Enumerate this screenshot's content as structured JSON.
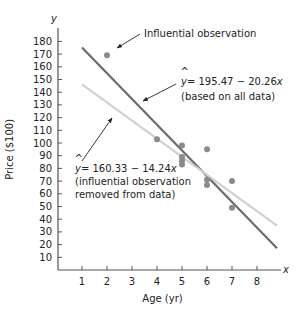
{
  "chart_data": {
    "type": "scatter",
    "title": "",
    "xlabel": "Age (yr)",
    "ylabel": "Price ($100)",
    "x_axis_symbol": "x",
    "y_axis_symbol": "y",
    "xlim": [
      0,
      9
    ],
    "ylim": [
      0,
      190
    ],
    "x_ticks": [
      1,
      2,
      3,
      4,
      5,
      6,
      7,
      8
    ],
    "y_ticks": [
      10,
      20,
      30,
      40,
      50,
      60,
      70,
      80,
      90,
      100,
      110,
      120,
      130,
      140,
      150,
      160,
      170,
      180
    ],
    "grid": false,
    "points": [
      {
        "x": 2,
        "y": 169,
        "influential": true
      },
      {
        "x": 4,
        "y": 103
      },
      {
        "x": 5,
        "y": 98
      },
      {
        "x": 5,
        "y": 89
      },
      {
        "x": 5,
        "y": 86
      },
      {
        "x": 5,
        "y": 83
      },
      {
        "x": 6,
        "y": 95
      },
      {
        "x": 6,
        "y": 71
      },
      {
        "x": 6,
        "y": 67
      },
      {
        "x": 7,
        "y": 70
      },
      {
        "x": 7,
        "y": 49
      }
    ],
    "series": [
      {
        "name": "Regression line (all data)",
        "equation": "ŷ = 195.47 − 20.26x",
        "intercept": 195.47,
        "slope": -20.26,
        "x_range": [
          1,
          8.8
        ],
        "color": "#6b6b6b"
      },
      {
        "name": "Regression line (influential observation removed)",
        "equation": "ŷ = 160.33 − 14.24x",
        "intercept": 160.33,
        "slope": -14.24,
        "x_range": [
          1,
          8.8
        ],
        "color": "#cfd0cf"
      }
    ],
    "annotations": [
      {
        "text": "Influential observation",
        "target": [
          2,
          169
        ]
      },
      {
        "line1": "= 195.47 − 20.26",
        "var": "x",
        "line2": "(based on all data)"
      },
      {
        "line1": "= 160.33 − 14.24",
        "var": "x",
        "line2": "(influential observation",
        "line3": "removed from data)"
      }
    ]
  },
  "colors": {
    "axis": "#555555",
    "point": "#8a8a8a",
    "dark_line": "#6b6b6b",
    "light_line": "#cfd0cf",
    "text": "#222222"
  }
}
